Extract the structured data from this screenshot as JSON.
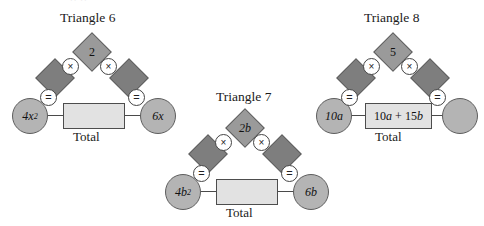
{
  "page": {
    "faint_header_fragment": "··  ··",
    "total_label": "Total",
    "op_multiply": "×",
    "op_equals": "="
  },
  "triangles": [
    {
      "id": "triangle-6",
      "title": "Triangle 6",
      "top_diamond": "2",
      "left_diamond": "",
      "right_diamond": "",
      "left_circle": "4x",
      "left_circle_sup": "2",
      "right_circle": "6x",
      "right_circle_sup": "",
      "total_value": "",
      "total_label": "Total",
      "ops": [
        "×",
        "×",
        "=",
        "="
      ]
    },
    {
      "id": "triangle-7",
      "title": "Triangle 7",
      "top_diamond": "2b",
      "left_diamond": "",
      "right_diamond": "",
      "left_circle": "4b",
      "left_circle_sup": "2",
      "right_circle": "6b",
      "right_circle_sup": "",
      "total_value": "",
      "total_label": "Total",
      "ops": [
        "×",
        "×",
        "=",
        "="
      ]
    },
    {
      "id": "triangle-8",
      "title": "Triangle 8",
      "top_diamond": "5",
      "left_diamond": "",
      "right_diamond": "",
      "left_circle": "10a",
      "left_circle_sup": "",
      "right_circle": "",
      "right_circle_sup": "",
      "total_value": "10a + 15b",
      "total_label": "Total",
      "ops": [
        "×",
        "×",
        "=",
        "="
      ]
    }
  ],
  "colors": {
    "diamond_fill": "#8a8a8a",
    "circle_fill": "#b4b4b4",
    "total_fill": "#e2e2e2",
    "stroke": "#5e5e5e",
    "text": "#111111"
  }
}
